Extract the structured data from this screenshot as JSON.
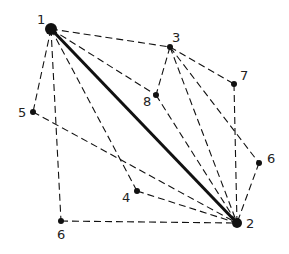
{
  "diagram": {
    "nodes": [
      {
        "id": "1",
        "label": "1",
        "x": 51,
        "y": 29,
        "r": 6,
        "lx": 37,
        "ly": 24
      },
      {
        "id": "2",
        "label": "2",
        "x": 237,
        "y": 223,
        "r": 5,
        "lx": 246,
        "ly": 228
      },
      {
        "id": "3",
        "label": "3",
        "x": 170,
        "y": 47,
        "r": 3,
        "lx": 172,
        "ly": 42
      },
      {
        "id": "4",
        "label": "4",
        "x": 137,
        "y": 191,
        "r": 3,
        "lx": 122,
        "ly": 202
      },
      {
        "id": "5",
        "label": "5",
        "x": 33,
        "y": 112,
        "r": 3,
        "lx": 18,
        "ly": 117
      },
      {
        "id": "6a",
        "label": "6",
        "x": 259,
        "y": 163,
        "r": 3,
        "lx": 267,
        "ly": 163
      },
      {
        "id": "6b",
        "label": "6",
        "x": 61,
        "y": 221,
        "r": 3,
        "lx": 57,
        "ly": 239
      },
      {
        "id": "7",
        "label": "7",
        "x": 234,
        "y": 84,
        "r": 3,
        "lx": 240,
        "ly": 80
      },
      {
        "id": "8",
        "label": "8",
        "x": 156,
        "y": 95,
        "r": 3,
        "lx": 143,
        "ly": 106
      }
    ],
    "edges": [
      {
        "from": "1",
        "to": "2",
        "style": "bold"
      },
      {
        "from": "1",
        "to": "3",
        "style": "dashed"
      },
      {
        "from": "1",
        "to": "8",
        "style": "dashed"
      },
      {
        "from": "1",
        "to": "4",
        "style": "dashed"
      },
      {
        "from": "1",
        "to": "6b",
        "style": "dashed"
      },
      {
        "from": "1",
        "to": "5",
        "style": "dashed"
      },
      {
        "from": "3",
        "to": "8",
        "style": "dashed"
      },
      {
        "from": "3",
        "to": "7",
        "style": "dashed"
      },
      {
        "from": "3",
        "to": "2",
        "style": "dashed"
      },
      {
        "from": "3",
        "to": "6a",
        "style": "dashed"
      },
      {
        "from": "7",
        "to": "2",
        "style": "dashed"
      },
      {
        "from": "8",
        "to": "2",
        "style": "dashed"
      },
      {
        "from": "6a",
        "to": "2",
        "style": "dashed"
      },
      {
        "from": "5",
        "to": "2",
        "style": "dashed"
      },
      {
        "from": "4",
        "to": "2",
        "style": "dashed"
      },
      {
        "from": "6b",
        "to": "2",
        "style": "dashed"
      }
    ]
  }
}
